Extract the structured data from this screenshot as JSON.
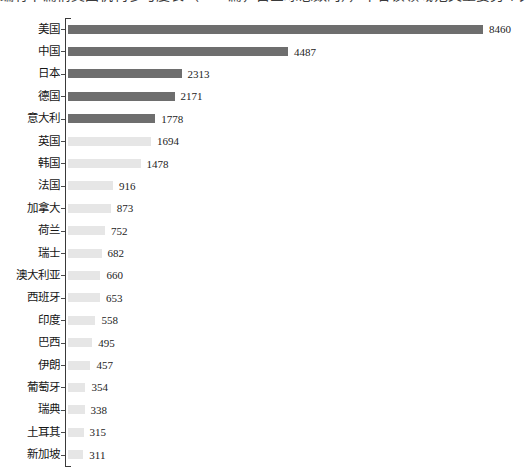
{
  "caption": {
    "text": "编有下篇情美国机构参与度长（8460篇，占全球总数的），下各该领域范文重要另个关国的"
  },
  "chart_data": {
    "type": "bar",
    "orientation": "horizontal",
    "title": "",
    "xlabel": "",
    "ylabel": "",
    "grid": false,
    "legend": false,
    "xlim": [
      0,
      8460
    ],
    "highlight_count": 5,
    "colors": {
      "bar_highlight": "#6e6e6e",
      "bar_default": "#e6e6e6",
      "axis": "#3a3a3a",
      "text": "#161616"
    },
    "categories": [
      "美国",
      "中国",
      "日本",
      "德国",
      "意大利",
      "英国",
      "韩国",
      "法国",
      "加拿大",
      "荷兰",
      "瑞士",
      "澳大利亚",
      "西班牙",
      "印度",
      "巴西",
      "伊朗",
      "葡萄牙",
      "瑞典",
      "土耳其",
      "新加坡"
    ],
    "values": [
      8460,
      4487,
      2313,
      2171,
      1778,
      1694,
      1478,
      916,
      873,
      752,
      682,
      660,
      653,
      558,
      495,
      457,
      354,
      338,
      315,
      311
    ]
  }
}
